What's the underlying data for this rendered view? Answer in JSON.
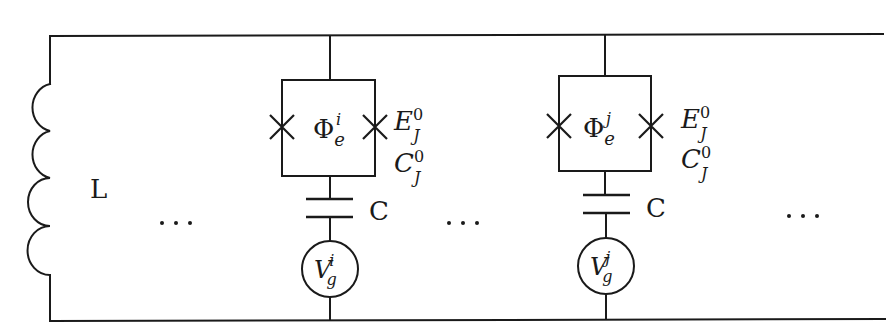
{
  "diagram": {
    "type": "circuit",
    "inductor": {
      "label": "L"
    },
    "ellipsis": "···",
    "branches": [
      {
        "id": "i",
        "flux": {
          "base": "Φ",
          "sub": "e",
          "sup": "i"
        },
        "junction_energy": {
          "base": "E",
          "sub": "J",
          "sup": "0"
        },
        "junction_capacitance": {
          "base": "C",
          "sub": "J",
          "sup": "0"
        },
        "coupling_capacitor": {
          "label": "C"
        },
        "gate_voltage": {
          "base": "V",
          "sub": "g",
          "sup": "i"
        }
      },
      {
        "id": "j",
        "flux": {
          "base": "Φ",
          "sub": "e",
          "sup": "j"
        },
        "junction_energy": {
          "base": "E",
          "sub": "J",
          "sup": "0"
        },
        "junction_capacitance": {
          "base": "C",
          "sub": "J",
          "sup": "0"
        },
        "coupling_capacitor": {
          "label": "C"
        },
        "gate_voltage": {
          "base": "V",
          "sub": "g",
          "sup": "j"
        }
      }
    ]
  }
}
